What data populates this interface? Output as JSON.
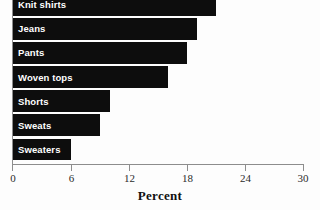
{
  "chart_data": {
    "type": "bar",
    "orientation": "horizontal",
    "title": "",
    "xlabel": "Percent",
    "ylabel": "",
    "xlim": [
      0,
      30
    ],
    "xticks": [
      0,
      6,
      12,
      18,
      24,
      30
    ],
    "xtick_labels": [
      "0",
      "6",
      "12",
      "18",
      "24",
      "30"
    ],
    "grid": false,
    "legend": null,
    "bar_color": "#0d0d0d",
    "label_color": "#ffffff",
    "axis_color": "#8d8d8d",
    "categories": [
      "Knit shirts",
      "Jeans",
      "Pants",
      "Woven tops",
      "Shorts",
      "Sweats",
      "Sweaters"
    ],
    "values": [
      21,
      19,
      18,
      16,
      10,
      9,
      6
    ],
    "points": [
      {
        "category": "Knit shirts",
        "value": 21
      },
      {
        "category": "Jeans",
        "value": 19
      },
      {
        "category": "Pants",
        "value": 18
      },
      {
        "category": "Woven tops",
        "value": 16
      },
      {
        "category": "Shorts",
        "value": 10
      },
      {
        "category": "Sweats",
        "value": 9
      },
      {
        "category": "Sweaters",
        "value": 6
      }
    ]
  }
}
